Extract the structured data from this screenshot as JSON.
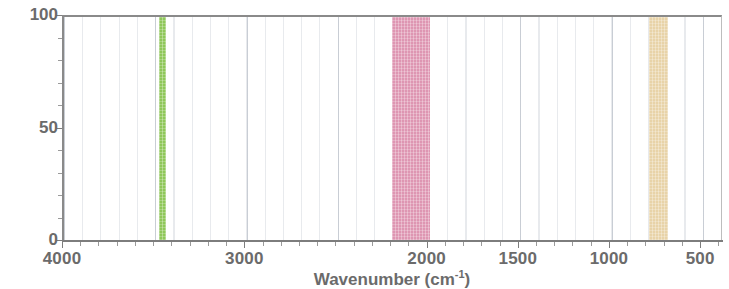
{
  "chart_data": {
    "type": "bar",
    "title": "",
    "subtitle": "",
    "xlabel_text": "Wavenumber (cm",
    "xlabel_sup": "-1",
    "xlabel_tail": ")",
    "xlabel_full": "Wavenumber (cm-1)",
    "ylabel": "",
    "xlim": [
      4000,
      380
    ],
    "ylim": [
      0,
      100
    ],
    "x_axis_inverted": true,
    "grid": true,
    "grid_axis": "x",
    "legend": "none",
    "x_ticks": [
      {
        "value": 4000,
        "label": "4000"
      },
      {
        "value": 3000,
        "label": "3000"
      },
      {
        "value": 2000,
        "label": "2000"
      },
      {
        "value": 1500,
        "label": "1500"
      },
      {
        "value": 1000,
        "label": "1000"
      },
      {
        "value": 500,
        "label": "500"
      }
    ],
    "x_minor_tick_step": 100,
    "y_ticks": [
      {
        "value": 100,
        "label": "100"
      },
      {
        "value": 50,
        "label": "50"
      },
      {
        "value": 0,
        "label": "0"
      }
    ],
    "y_minor_tick_step": 10,
    "bands": [
      {
        "name": "green-band",
        "x_start": 3480,
        "x_end": 3440,
        "value": 100,
        "color": "#8FC75A",
        "label": ""
      },
      {
        "name": "pink-band",
        "x_start": 2200,
        "x_end": 1995,
        "value": 100,
        "color": "#DE96B2",
        "label": ""
      },
      {
        "name": "tan-band",
        "x_start": 790,
        "x_end": 685,
        "value": 100,
        "color": "#E8D3A8",
        "label": ""
      }
    ],
    "colors": {
      "green": "#8FC75A",
      "pink": "#DE96B2",
      "tan": "#E8D3A8",
      "axis": "#7d7d7d",
      "text": "#6b6b6b",
      "grid": "#96a0af",
      "background": "#ffffff"
    }
  }
}
